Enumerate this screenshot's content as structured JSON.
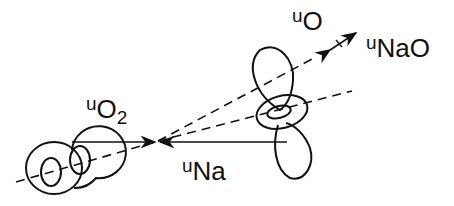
{
  "diagram": {
    "type": "newton-vector-diagram",
    "labels": {
      "u_o2": {
        "prefix": "u",
        "main": "O",
        "sub": "2"
      },
      "u_na": {
        "prefix": "u",
        "main": "Na"
      },
      "u_o": {
        "prefix": "u",
        "main": "O"
      },
      "u_nao": {
        "prefix": "u",
        "main": "NaO"
      }
    },
    "elements": [
      "O2 molecule (two overlapping toroidal orbitals)",
      "Na p-orbital (lobes with torus)",
      "velocity vectors converging at center",
      "dashed axes"
    ],
    "colors": {
      "ink": "#111111",
      "background": "#ffffff"
    }
  }
}
